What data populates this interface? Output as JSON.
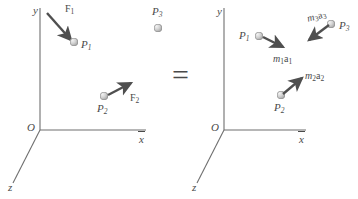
{
  "figure": {
    "equals_sign": "=",
    "stroke_color": "#6f6f6f",
    "arrow_color": "#4f4f4f",
    "text_color": "#4a4a4a",
    "sphere_color": "#c9c9c9"
  },
  "left_panel": {
    "name": "force-diagram",
    "axes": {
      "x_label": "x",
      "y_label": "y",
      "z_label": "z",
      "origin_label": "O"
    },
    "particles": [
      {
        "id": "P1",
        "label": "P",
        "sub": "1"
      },
      {
        "id": "P2",
        "label": "P",
        "sub": "2"
      },
      {
        "id": "P3",
        "label": "P",
        "sub": "3"
      }
    ],
    "vectors": [
      {
        "id": "F1",
        "symbol": "F",
        "sub": "1",
        "target": "P1",
        "direction": "down-right-into-particle"
      },
      {
        "id": "F2",
        "symbol": "F",
        "sub": "2",
        "target": "P2",
        "direction": "up-right-from-particle"
      }
    ]
  },
  "right_panel": {
    "name": "inertia-diagram",
    "axes": {
      "x_label": "x",
      "y_label": "y",
      "z_label": "z",
      "origin_label": "O"
    },
    "particles": [
      {
        "id": "P1",
        "label": "P",
        "sub": "1"
      },
      {
        "id": "P2",
        "label": "P",
        "sub": "2"
      },
      {
        "id": "P3",
        "label": "P",
        "sub": "3"
      }
    ],
    "vectors": [
      {
        "id": "m1a1",
        "mass": "m",
        "mass_sub": "1",
        "accel": "a",
        "accel_sub": "1",
        "target": "P1",
        "direction": "down-right-from-particle"
      },
      {
        "id": "m2a2",
        "mass": "m",
        "mass_sub": "2",
        "accel": "a",
        "accel_sub": "2",
        "target": "P2",
        "direction": "up-right-from-particle"
      },
      {
        "id": "m3a3",
        "mass": "m",
        "mass_sub": "3",
        "accel": "a",
        "accel_sub": "3",
        "target": "P3",
        "direction": "down-left-from-particle"
      }
    ]
  }
}
